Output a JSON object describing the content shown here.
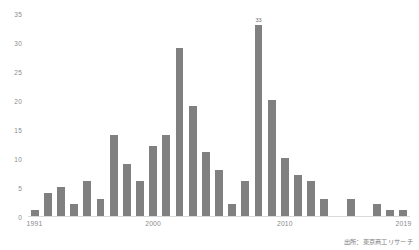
{
  "chart_data": {
    "type": "bar",
    "title": "",
    "xlabel": "",
    "ylabel": "",
    "ylim": [
      0,
      35
    ],
    "ytick_step": 5,
    "grid": false,
    "legend": null,
    "bar_color": "#808080",
    "axis_text_color": "#8c8c8c",
    "categories": [
      "1991",
      "1992",
      "1993",
      "1994",
      "1995",
      "1996",
      "1997",
      "1998",
      "1999",
      "2000",
      "2001",
      "2002",
      "2003",
      "2004",
      "2005",
      "2006",
      "2007",
      "2008",
      "2009",
      "2010",
      "2011",
      "2012",
      "2013",
      "2014",
      "2015",
      "2016",
      "2017",
      "2018",
      "2019"
    ],
    "values": [
      1,
      4,
      5,
      2,
      6,
      3,
      14,
      9,
      6,
      12,
      14,
      29,
      19,
      11,
      8,
      2,
      6,
      33,
      20,
      10,
      7,
      6,
      3,
      0,
      3,
      0,
      2,
      1,
      1
    ],
    "yticks": [
      "0",
      "5",
      "10",
      "15",
      "20",
      "25",
      "30",
      "35"
    ],
    "xticks": [
      {
        "label": "1991",
        "index": 0
      },
      {
        "label": "2000",
        "index": 9
      },
      {
        "label": "2010",
        "index": 19
      },
      {
        "label": "2019",
        "index": 28
      }
    ],
    "annotations": [
      {
        "index": 17,
        "text": "33"
      }
    ]
  },
  "source": {
    "note": "出所：東京商工リサーチ"
  }
}
